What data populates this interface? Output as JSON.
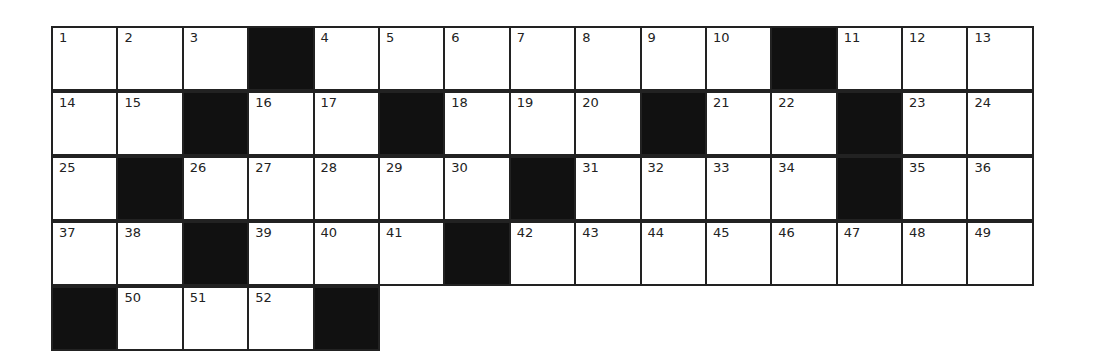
{
  "puzzle": {
    "columns": 15,
    "rows": [
      [
        {
          "n": "1"
        },
        {
          "n": "2"
        },
        {
          "n": "3"
        },
        {
          "b": true
        },
        {
          "n": "4"
        },
        {
          "n": "5"
        },
        {
          "n": "6"
        },
        {
          "n": "7"
        },
        {
          "n": "8"
        },
        {
          "n": "9"
        },
        {
          "n": "10"
        },
        {
          "b": true
        },
        {
          "n": "11"
        },
        {
          "n": "12"
        },
        {
          "n": "13"
        }
      ],
      [
        {
          "n": "14"
        },
        {
          "n": "15"
        },
        {
          "b": true
        },
        {
          "n": "16"
        },
        {
          "n": "17"
        },
        {
          "b": true
        },
        {
          "n": "18"
        },
        {
          "n": "19"
        },
        {
          "n": "20"
        },
        {
          "b": true
        },
        {
          "n": "21"
        },
        {
          "n": "22"
        },
        {
          "b": true
        },
        {
          "n": "23"
        },
        {
          "n": "24"
        }
      ],
      [
        {
          "n": "25"
        },
        {
          "b": true
        },
        {
          "n": "26"
        },
        {
          "n": "27"
        },
        {
          "n": "28"
        },
        {
          "n": "29"
        },
        {
          "n": "30"
        },
        {
          "b": true
        },
        {
          "n": "31"
        },
        {
          "n": "32"
        },
        {
          "n": "33"
        },
        {
          "n": "34"
        },
        {
          "b": true
        },
        {
          "n": "35"
        },
        {
          "n": "36"
        }
      ],
      [
        {
          "n": "37"
        },
        {
          "n": "38"
        },
        {
          "b": true
        },
        {
          "n": "39"
        },
        {
          "n": "40"
        },
        {
          "n": "41"
        },
        {
          "b": true
        },
        {
          "n": "42"
        },
        {
          "n": "43"
        },
        {
          "n": "44"
        },
        {
          "n": "45"
        },
        {
          "n": "46"
        },
        {
          "n": "47"
        },
        {
          "n": "48"
        },
        {
          "n": "49"
        }
      ],
      [
        {
          "b": true
        },
        {
          "n": "50"
        },
        {
          "n": "51"
        },
        {
          "n": "52"
        },
        {
          "b": true
        }
      ]
    ]
  }
}
